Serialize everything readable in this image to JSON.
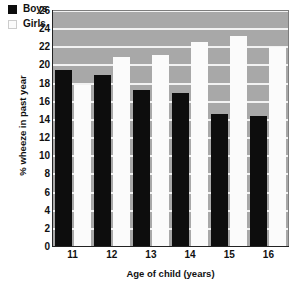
{
  "chart_data": {
    "type": "bar",
    "title": "",
    "xlabel": "Age of child (years)",
    "ylabel": "% wheeze in past year",
    "categories": [
      "11",
      "12",
      "13",
      "14",
      "15",
      "16"
    ],
    "series": [
      {
        "name": "Boys",
        "color": "#0d0d0d",
        "values": [
          19.5,
          19.0,
          17.3,
          17.0,
          14.6,
          14.4
        ]
      },
      {
        "name": "Girls",
        "color": "#fbfbfb",
        "values": [
          17.8,
          20.9,
          21.1,
          22.6,
          23.2,
          22.0
        ]
      }
    ],
    "ylim": [
      0,
      26
    ],
    "ytick_step": 2,
    "yticks": [
      0,
      2,
      4,
      6,
      8,
      10,
      12,
      14,
      16,
      18,
      20,
      22,
      24,
      26
    ],
    "ytick_labels": [
      "0",
      "2",
      "4",
      "6",
      "8",
      "10",
      "12",
      "14",
      "16",
      "18",
      "20",
      "22",
      "24",
      "26"
    ],
    "grid": true,
    "grid_orientation": "horizontal",
    "legend_position": "top-left",
    "plot_background": "#a8a8a8",
    "gridline_color": "#f2f2f2",
    "figure_background": "#ffffff"
  },
  "legend": {
    "items": [
      {
        "label": "Boys",
        "swatch": "black-square-swatch"
      },
      {
        "label": "Girls",
        "swatch": "white-square-swatch"
      }
    ]
  },
  "axes": {
    "x_title": "Age of child (years)",
    "y_title": "% wheeze in past year"
  }
}
